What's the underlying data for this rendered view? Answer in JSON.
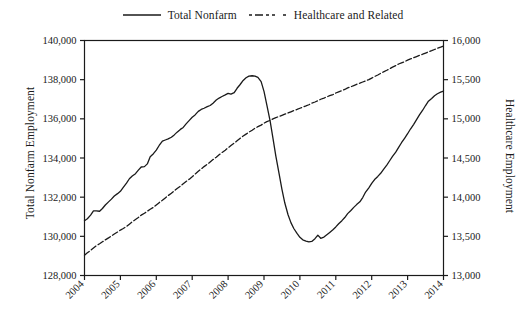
{
  "legend": {
    "entries": [
      {
        "label": "Total Nonfarm",
        "style": "solid",
        "color": "#1a1a1a"
      },
      {
        "label": "Healthcare and Related",
        "style": "dashed",
        "color": "#1a1a1a"
      }
    ]
  },
  "axes": {
    "left_title": "Total Nonfarm Employment",
    "right_title": "Healthcare Employment"
  },
  "chart_data": {
    "type": "line",
    "title": "",
    "xlabel": "",
    "ylabel": "Total Nonfarm Employment",
    "y2label": "Healthcare Employment",
    "grid": false,
    "legend_position": "top-center",
    "x": [
      2004,
      2005,
      2006,
      2007,
      2008,
      2009,
      2010,
      2011,
      2012,
      2013,
      2014
    ],
    "xlim": [
      2004,
      2014
    ],
    "xtick_labels": [
      "2004",
      "2005",
      "2006",
      "2007",
      "2008",
      "2009",
      "2010",
      "2011",
      "2012",
      "2013",
      "2014"
    ],
    "ylim": [
      128000,
      140000
    ],
    "ytick_labels": [
      "128,000",
      "130,000",
      "132,000",
      "134,000",
      "136,000",
      "138,000",
      "140,000"
    ],
    "yticks": [
      128000,
      130000,
      132000,
      134000,
      136000,
      138000,
      140000
    ],
    "y2lim": [
      13000,
      16000
    ],
    "y2tick_labels": [
      "13,000",
      "13,500",
      "14,000",
      "14,500",
      "15,000",
      "15,500",
      "16,000"
    ],
    "y2ticks": [
      13000,
      13500,
      14000,
      14500,
      15000,
      15500,
      16000
    ],
    "series": [
      {
        "name": "Total Nonfarm",
        "axis": "left",
        "style": "solid",
        "color": "#1a1a1a",
        "x": [
          2004.0,
          2004.08,
          2004.17,
          2004.25,
          2004.33,
          2004.42,
          2004.5,
          2004.58,
          2004.67,
          2004.75,
          2004.83,
          2004.92,
          2005.0,
          2005.08,
          2005.17,
          2005.25,
          2005.33,
          2005.42,
          2005.5,
          2005.58,
          2005.67,
          2005.75,
          2005.83,
          2005.92,
          2006.0,
          2006.08,
          2006.17,
          2006.25,
          2006.33,
          2006.42,
          2006.5,
          2006.58,
          2006.67,
          2006.75,
          2006.83,
          2006.92,
          2007.0,
          2007.08,
          2007.17,
          2007.25,
          2007.33,
          2007.42,
          2007.5,
          2007.58,
          2007.67,
          2007.75,
          2007.83,
          2007.92,
          2008.0,
          2008.08,
          2008.17,
          2008.25,
          2008.33,
          2008.42,
          2008.5,
          2008.58,
          2008.67,
          2008.75,
          2008.83,
          2008.92,
          2009.0,
          2009.08,
          2009.17,
          2009.25,
          2009.33,
          2009.42,
          2009.5,
          2009.58,
          2009.67,
          2009.75,
          2009.83,
          2009.92,
          2010.0,
          2010.08,
          2010.17,
          2010.25,
          2010.33,
          2010.42,
          2010.5,
          2010.58,
          2010.67,
          2010.75,
          2010.83,
          2010.92,
          2011.0,
          2011.08,
          2011.17,
          2011.25,
          2011.33,
          2011.42,
          2011.5,
          2011.58,
          2011.67,
          2011.75,
          2011.83,
          2011.92,
          2012.0,
          2012.08,
          2012.17,
          2012.25,
          2012.33,
          2012.42,
          2012.5,
          2012.58,
          2012.67,
          2012.75,
          2012.83,
          2012.92,
          2013.0,
          2013.08,
          2013.17,
          2013.25,
          2013.33,
          2013.42,
          2013.5,
          2013.58,
          2013.67,
          2013.75,
          2013.83,
          2013.92,
          2014.0
        ],
        "values": [
          130800,
          130900,
          131080,
          131300,
          131300,
          131280,
          131420,
          131600,
          131760,
          131900,
          132060,
          132180,
          132300,
          132500,
          132720,
          132940,
          133080,
          133200,
          133380,
          133540,
          133560,
          133700,
          134060,
          134220,
          134400,
          134640,
          134860,
          134920,
          134980,
          135060,
          135180,
          135320,
          135460,
          135560,
          135740,
          135920,
          136080,
          136200,
          136380,
          136480,
          136540,
          136620,
          136680,
          136800,
          136960,
          137060,
          137140,
          137220,
          137300,
          137260,
          137340,
          137560,
          137740,
          137960,
          138100,
          138180,
          138200,
          138180,
          138120,
          137900,
          137400,
          136700,
          135900,
          135000,
          134100,
          133200,
          132400,
          131700,
          131100,
          130700,
          130400,
          130150,
          129950,
          129820,
          129760,
          129720,
          129740,
          129880,
          130060,
          129900,
          129960,
          130080,
          130200,
          130340,
          130480,
          130640,
          130800,
          130960,
          131160,
          131320,
          131480,
          131620,
          131760,
          131980,
          132260,
          132480,
          132700,
          132900,
          133060,
          133220,
          133420,
          133640,
          133860,
          134080,
          134300,
          134540,
          134780,
          135020,
          135240,
          135480,
          135720,
          135960,
          136200,
          136440,
          136680,
          136900,
          137040,
          137180,
          137280,
          137360,
          137420
        ]
      },
      {
        "name": "Healthcare and Related",
        "axis": "right",
        "style": "dashed",
        "color": "#1a1a1a",
        "x": [
          2004.0,
          2004.08,
          2004.17,
          2004.25,
          2004.33,
          2004.42,
          2004.5,
          2004.58,
          2004.67,
          2004.75,
          2004.83,
          2004.92,
          2005.0,
          2005.08,
          2005.17,
          2005.25,
          2005.33,
          2005.42,
          2005.5,
          2005.58,
          2005.67,
          2005.75,
          2005.83,
          2005.92,
          2006.0,
          2006.08,
          2006.17,
          2006.25,
          2006.33,
          2006.42,
          2006.5,
          2006.58,
          2006.67,
          2006.75,
          2006.83,
          2006.92,
          2007.0,
          2007.08,
          2007.17,
          2007.25,
          2007.33,
          2007.42,
          2007.5,
          2007.58,
          2007.67,
          2007.75,
          2007.83,
          2007.92,
          2008.0,
          2008.08,
          2008.17,
          2008.25,
          2008.33,
          2008.42,
          2008.5,
          2008.58,
          2008.67,
          2008.75,
          2008.83,
          2008.92,
          2009.0,
          2009.08,
          2009.17,
          2009.25,
          2009.33,
          2009.42,
          2009.5,
          2009.58,
          2009.67,
          2009.75,
          2009.83,
          2009.92,
          2010.0,
          2010.08,
          2010.17,
          2010.25,
          2010.33,
          2010.42,
          2010.5,
          2010.58,
          2010.67,
          2010.75,
          2010.83,
          2010.92,
          2011.0,
          2011.08,
          2011.17,
          2011.25,
          2011.33,
          2011.42,
          2011.5,
          2011.58,
          2011.67,
          2011.75,
          2011.83,
          2011.92,
          2012.0,
          2012.08,
          2012.17,
          2012.25,
          2012.33,
          2012.42,
          2012.5,
          2012.58,
          2012.67,
          2012.75,
          2012.83,
          2012.92,
          2013.0,
          2013.08,
          2013.17,
          2013.25,
          2013.33,
          2013.42,
          2013.5,
          2013.58,
          2013.67,
          2013.75,
          2013.83,
          2013.92,
          2014.0
        ],
        "values": [
          13260,
          13290,
          13320,
          13350,
          13380,
          13405,
          13430,
          13455,
          13480,
          13505,
          13530,
          13555,
          13580,
          13600,
          13625,
          13655,
          13685,
          13715,
          13740,
          13770,
          13795,
          13820,
          13845,
          13870,
          13900,
          13930,
          13960,
          13990,
          14020,
          14050,
          14080,
          14110,
          14140,
          14170,
          14200,
          14230,
          14260,
          14295,
          14330,
          14360,
          14390,
          14420,
          14450,
          14480,
          14510,
          14540,
          14570,
          14600,
          14630,
          14660,
          14690,
          14720,
          14750,
          14780,
          14805,
          14830,
          14855,
          14880,
          14900,
          14920,
          14945,
          14965,
          14980,
          15000,
          15015,
          15030,
          15045,
          15060,
          15075,
          15090,
          15105,
          15120,
          15135,
          15150,
          15165,
          15180,
          15200,
          15215,
          15230,
          15250,
          15265,
          15280,
          15295,
          15310,
          15330,
          15345,
          15360,
          15375,
          15395,
          15410,
          15425,
          15440,
          15455,
          15470,
          15485,
          15500,
          15520,
          15540,
          15560,
          15580,
          15600,
          15620,
          15640,
          15660,
          15680,
          15700,
          15715,
          15730,
          15750,
          15765,
          15780,
          15795,
          15810,
          15825,
          15840,
          15855,
          15870,
          15885,
          15900,
          15915,
          15930
        ]
      }
    ]
  }
}
